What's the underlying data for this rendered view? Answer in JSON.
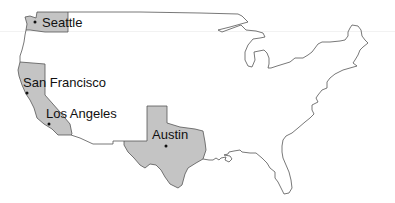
{
  "map": {
    "title": "",
    "region": "Contiguous United States",
    "highlight_color": "#c4c4c4",
    "outline_color": "#555555",
    "highlighted_states": [
      "Washington",
      "California",
      "Texas"
    ],
    "cities": [
      {
        "name": "Seattle",
        "state": "Washington",
        "label": "Seattle"
      },
      {
        "name": "San Francisco",
        "state": "California",
        "label": "San Francisco"
      },
      {
        "name": "Los Angeles",
        "state": "California",
        "label": "Los Angeles"
      },
      {
        "name": "Austin",
        "state": "Texas",
        "label": "Austin"
      }
    ]
  }
}
